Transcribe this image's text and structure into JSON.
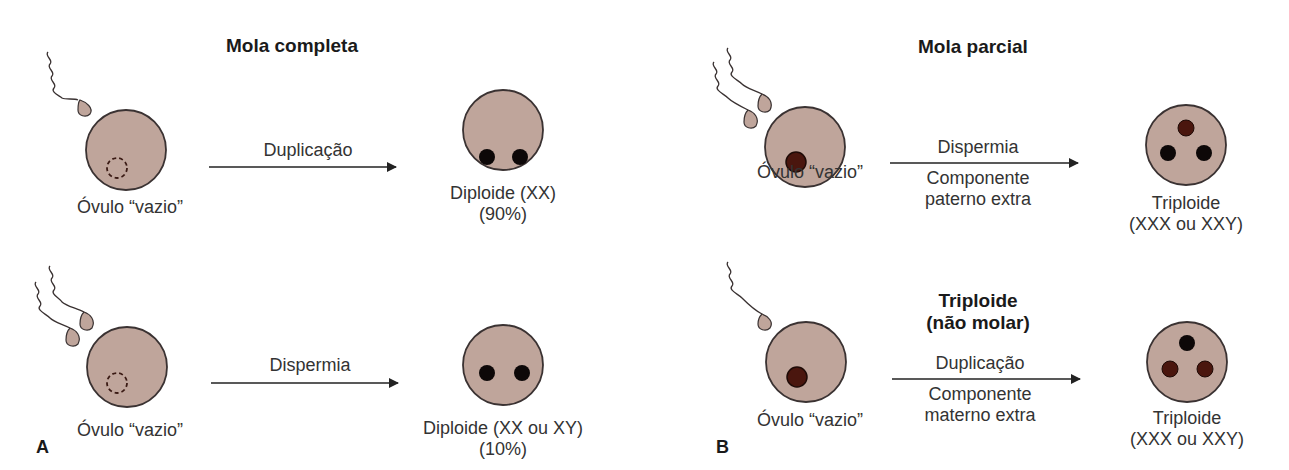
{
  "colors": {
    "cell_fill": "#bfa59b",
    "cell_stroke": "#3a3232",
    "paternal_nucleus": "#0d0808",
    "maternal_nucleus": "#4a160e",
    "arrow": "#222222",
    "text": "#333333"
  },
  "panel_a": {
    "letter": "A",
    "title": "Mola completa",
    "rows": [
      {
        "sperm_count": 1,
        "egg_label": "Óvulo “vazio”",
        "egg_nucleus": "empty-dashed",
        "arrow_label_top": "Duplicação",
        "result_label": "Diploide (XX)",
        "result_sublabel": "(90%)",
        "result_nuclei": [
          "paternal",
          "paternal"
        ]
      },
      {
        "sperm_count": 2,
        "egg_label": "Óvulo “vazio”",
        "egg_nucleus": "empty-dashed",
        "arrow_label_top": "Dispermia",
        "result_label": "Diploide (XX ou XY)",
        "result_sublabel": "(10%)",
        "result_nuclei": [
          "paternal",
          "paternal"
        ]
      }
    ]
  },
  "panel_b": {
    "letter": "B",
    "rows": [
      {
        "title": "Mola parcial",
        "sperm_count": 2,
        "egg_label": "Óvulo “vazio”",
        "egg_nucleus": "maternal",
        "arrow_label_top": "Dispermia",
        "arrow_label_bottom_1": "Componente",
        "arrow_label_bottom_2": "paterno extra",
        "result_label": "Triploide",
        "result_sublabel": "(XXX ou XXY)",
        "result_nuclei": [
          "maternal",
          "paternal",
          "paternal"
        ]
      },
      {
        "title_1": "Triploide",
        "title_2": "(não molar)",
        "sperm_count": 1,
        "egg_label": "Óvulo “vazio”",
        "egg_nucleus": "maternal",
        "arrow_label_top": "Duplicação",
        "arrow_label_bottom_1": "Componente",
        "arrow_label_bottom_2": "materno extra",
        "result_label": "Triploide",
        "result_sublabel": "(XXX ou XXY)",
        "result_nuclei": [
          "paternal",
          "maternal",
          "maternal"
        ]
      }
    ]
  }
}
